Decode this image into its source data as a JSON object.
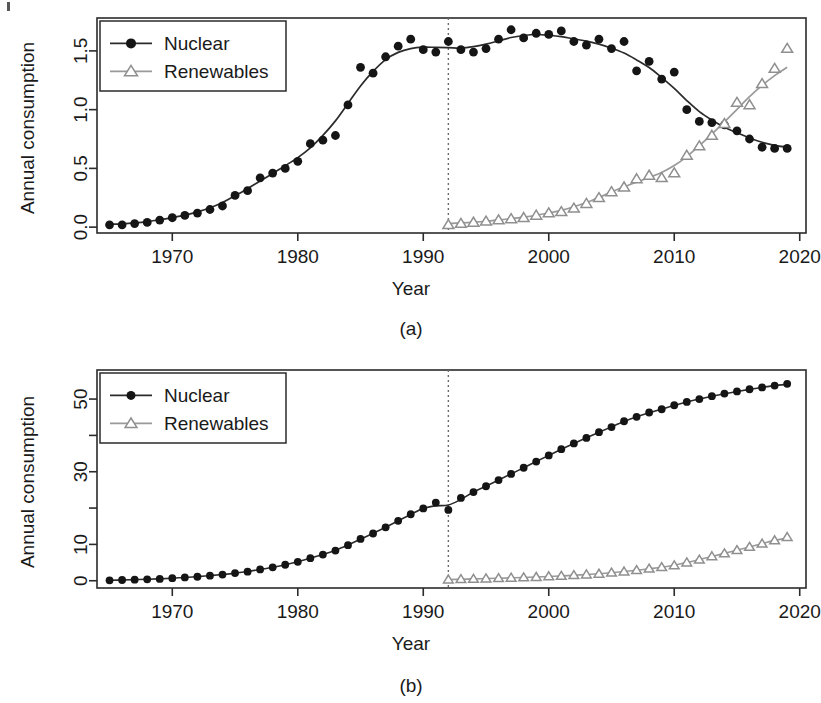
{
  "figure": {
    "panels": [
      {
        "tag": "(a)",
        "xlabel": "Year",
        "ylabel": "Annual consumption"
      },
      {
        "tag": "(b)",
        "xlabel": "Year",
        "ylabel": "Annual consumption"
      }
    ],
    "legend": {
      "nuclear_label": "Nuclear",
      "renewables_label": "Renewables"
    },
    "colors": {
      "nuclear": "#151515",
      "renewables": "#9a9a9a",
      "axis": "#2b2b2b",
      "background": "#ffffff",
      "reference_line": "#6b6b6b"
    }
  },
  "chart_data": [
    {
      "type": "scatter",
      "panel": "(a)",
      "title": "",
      "xlabel": "Year",
      "ylabel": "Annual consumption",
      "xlim": [
        1964,
        2020.5
      ],
      "ylim": [
        -0.05,
        1.78
      ],
      "xticks": [
        1970,
        1980,
        1990,
        2000,
        2010,
        2020
      ],
      "xticklabels": [
        "1970",
        "1980",
        "1990",
        "2000",
        "2010",
        "2020"
      ],
      "yticks": [
        0.0,
        0.5,
        1.0,
        1.5
      ],
      "yticklabels": [
        "0.0",
        "0.5",
        "1.0",
        "1.5"
      ],
      "grid": false,
      "legend_position": "top-left",
      "annotations": [
        {
          "type": "vertical-dotted-line",
          "x": 1992,
          "label": ""
        }
      ],
      "x": [
        1965,
        1966,
        1967,
        1968,
        1969,
        1970,
        1971,
        1972,
        1973,
        1974,
        1975,
        1976,
        1977,
        1978,
        1979,
        1980,
        1981,
        1982,
        1983,
        1984,
        1985,
        1986,
        1987,
        1988,
        1989,
        1990,
        1991,
        1992,
        1993,
        1994,
        1995,
        1996,
        1997,
        1998,
        1999,
        2000,
        2001,
        2002,
        2003,
        2004,
        2005,
        2006,
        2007,
        2008,
        2009,
        2010,
        2011,
        2012,
        2013,
        2014,
        2015,
        2016,
        2017,
        2018,
        2019
      ],
      "series": [
        {
          "name": "Nuclear",
          "marker": "filled-circle",
          "values": [
            0.02,
            0.02,
            0.03,
            0.04,
            0.06,
            0.08,
            0.1,
            0.12,
            0.15,
            0.18,
            0.27,
            0.31,
            0.42,
            0.46,
            0.5,
            0.56,
            0.71,
            0.74,
            0.78,
            1.04,
            1.36,
            1.31,
            1.45,
            1.54,
            1.6,
            1.51,
            1.49,
            1.58,
            1.51,
            1.49,
            1.52,
            1.6,
            1.68,
            1.61,
            1.65,
            1.64,
            1.67,
            1.58,
            1.55,
            1.6,
            1.52,
            1.58,
            1.33,
            1.41,
            1.26,
            1.32,
            1.0,
            0.9,
            0.89,
            0.87,
            0.82,
            0.75,
            0.68,
            0.67,
            0.67
          ],
          "fit_curve": "smoothed-logistic-decline"
        },
        {
          "name": "Renewables",
          "marker": "open-triangle",
          "x_start": 1992,
          "values": [
            null,
            null,
            null,
            null,
            null,
            null,
            null,
            null,
            null,
            null,
            null,
            null,
            null,
            null,
            null,
            null,
            null,
            null,
            null,
            null,
            null,
            null,
            null,
            null,
            null,
            null,
            null,
            0.02,
            0.03,
            0.04,
            0.05,
            0.06,
            0.07,
            0.08,
            0.1,
            0.12,
            0.13,
            0.16,
            0.2,
            0.25,
            0.3,
            0.34,
            0.41,
            0.44,
            0.42,
            0.46,
            0.61,
            0.69,
            0.78,
            0.88,
            1.06,
            1.04,
            1.22,
            1.35,
            1.52
          ],
          "fit_curve": "smoothed-exponential-growth"
        }
      ]
    },
    {
      "type": "line",
      "panel": "(b)",
      "title": "",
      "xlabel": "Year",
      "ylabel": "Annual consumption",
      "xlim": [
        1964,
        2020.5
      ],
      "ylim": [
        -2,
        58
      ],
      "xticks": [
        1970,
        1980,
        1990,
        2000,
        2010,
        2020
      ],
      "xticklabels": [
        "1970",
        "1980",
        "1990",
        "2000",
        "2010",
        "2020"
      ],
      "yticks": [
        0,
        10,
        20,
        30,
        40,
        50
      ],
      "yticklabels": [
        "0",
        "10",
        "",
        "30",
        "",
        "50"
      ],
      "grid": false,
      "legend_position": "top-left",
      "annotations": [
        {
          "type": "vertical-dotted-line",
          "x": 1992,
          "label": ""
        }
      ],
      "x": [
        1965,
        1966,
        1967,
        1968,
        1969,
        1970,
        1971,
        1972,
        1973,
        1974,
        1975,
        1976,
        1977,
        1978,
        1979,
        1980,
        1981,
        1982,
        1983,
        1984,
        1985,
        1986,
        1987,
        1988,
        1989,
        1990,
        1991,
        1992,
        1993,
        1994,
        1995,
        1996,
        1997,
        1998,
        1999,
        2000,
        2001,
        2002,
        2003,
        2004,
        2005,
        2006,
        2007,
        2008,
        2009,
        2010,
        2011,
        2012,
        2013,
        2014,
        2015,
        2016,
        2017,
        2018,
        2019
      ],
      "series": [
        {
          "name": "Nuclear",
          "marker": "filled-circle",
          "values": [
            0.1,
            0.2,
            0.3,
            0.4,
            0.5,
            0.7,
            0.9,
            1.1,
            1.4,
            1.7,
            2.1,
            2.5,
            3.1,
            3.7,
            4.4,
            5.2,
            6.2,
            7.2,
            8.3,
            9.8,
            11.5,
            13.0,
            14.7,
            16.5,
            18.3,
            19.9,
            21.5,
            19.5,
            22.8,
            24.4,
            26.0,
            27.7,
            29.4,
            31.1,
            32.8,
            34.5,
            36.2,
            37.8,
            39.3,
            40.9,
            42.3,
            43.9,
            45.1,
            46.3,
            47.2,
            48.3,
            49.2,
            50.0,
            50.8,
            51.5,
            52.1,
            52.7,
            53.2,
            53.7,
            54.2
          ],
          "connected": true
        },
        {
          "name": "Renewables",
          "marker": "open-triangle",
          "x_start": 1992,
          "values": [
            null,
            null,
            null,
            null,
            null,
            null,
            null,
            null,
            null,
            null,
            null,
            null,
            null,
            null,
            null,
            null,
            null,
            null,
            null,
            null,
            null,
            null,
            null,
            null,
            null,
            null,
            null,
            0.3,
            0.4,
            0.5,
            0.6,
            0.7,
            0.8,
            0.9,
            1.0,
            1.2,
            1.3,
            1.5,
            1.7,
            1.9,
            2.2,
            2.5,
            2.9,
            3.3,
            3.7,
            4.2,
            5.0,
            5.8,
            6.7,
            7.5,
            8.4,
            9.3,
            10.2,
            11.1,
            12.0
          ],
          "connected": true
        }
      ]
    }
  ]
}
